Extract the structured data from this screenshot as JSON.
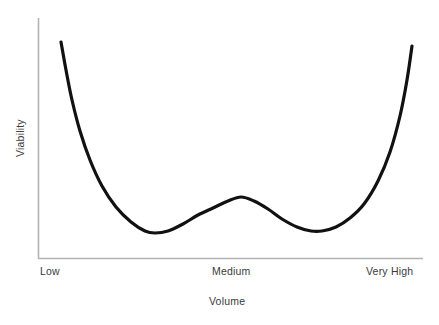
{
  "chart_data": {
    "type": "line",
    "title": "",
    "subtitle": "",
    "xlabel": "Volume",
    "ylabel": "Viability",
    "grid": false,
    "legend": null,
    "legend_position": "none",
    "annotations": [],
    "xtick_labels": [
      "Low",
      "Medium",
      "Very High"
    ],
    "xtick_positions": [
      0,
      50,
      100
    ],
    "ytick_labels": [],
    "xlim": [
      0,
      100
    ],
    "ylim": [
      0,
      100
    ],
    "axis_color": "#b3b3b3",
    "curve_color": "#111111",
    "curve_width_px": 3.2,
    "background_color": "#ffffff",
    "text_color": "#3a3a3a",
    "series": [
      {
        "name": "Viability vs Volume",
        "x": [
          6,
          8,
          11,
          14,
          18,
          22,
          27,
          31,
          36,
          41,
          46,
          50,
          54,
          58,
          63,
          68,
          73,
          77,
          81,
          85,
          89,
          92,
          95,
          97,
          98
        ],
        "y": [
          90,
          80,
          68,
          57,
          46,
          37,
          29,
          24,
          20,
          19,
          21,
          25,
          29,
          30,
          28,
          24,
          21,
          20,
          21,
          26,
          35,
          47,
          63,
          79,
          88
        ],
        "points_px": [
          {
            "x": 61,
            "y": 42
          },
          {
            "x": 66,
            "y": 70
          },
          {
            "x": 72,
            "y": 100
          },
          {
            "x": 80,
            "y": 131
          },
          {
            "x": 90,
            "y": 160
          },
          {
            "x": 102,
            "y": 186
          },
          {
            "x": 116,
            "y": 207
          },
          {
            "x": 131,
            "y": 222
          },
          {
            "x": 145,
            "y": 231
          },
          {
            "x": 155,
            "y": 233
          },
          {
            "x": 168,
            "y": 231
          },
          {
            "x": 183,
            "y": 224
          },
          {
            "x": 198,
            "y": 215
          },
          {
            "x": 213,
            "y": 208
          },
          {
            "x": 228,
            "y": 201
          },
          {
            "x": 241,
            "y": 197
          },
          {
            "x": 254,
            "y": 201
          },
          {
            "x": 268,
            "y": 209
          },
          {
            "x": 282,
            "y": 219
          },
          {
            "x": 297,
            "y": 227
          },
          {
            "x": 311,
            "y": 231
          },
          {
            "x": 322,
            "y": 231
          },
          {
            "x": 336,
            "y": 227
          },
          {
            "x": 350,
            "y": 218
          },
          {
            "x": 364,
            "y": 204
          },
          {
            "x": 378,
            "y": 181
          },
          {
            "x": 390,
            "y": 152
          },
          {
            "x": 400,
            "y": 116
          },
          {
            "x": 407,
            "y": 80
          },
          {
            "x": 412,
            "y": 46
          }
        ],
        "key_features": [
          {
            "label": "left endpoint",
            "x_px": 61,
            "y_px": 42
          },
          {
            "label": "left minimum",
            "x_px": 153,
            "y_px": 233
          },
          {
            "label": "central peak",
            "x_px": 241,
            "y_px": 197
          },
          {
            "label": "right minimum",
            "x_px": 318,
            "y_px": 231
          },
          {
            "label": "right endpoint",
            "x_px": 412,
            "y_px": 46
          }
        ]
      }
    ],
    "axes_px": {
      "y_axis_x": 38,
      "y_axis_top": 18,
      "y_axis_bottom": 258,
      "x_axis_y": 258,
      "x_axis_left": 38,
      "x_axis_right": 423
    }
  }
}
